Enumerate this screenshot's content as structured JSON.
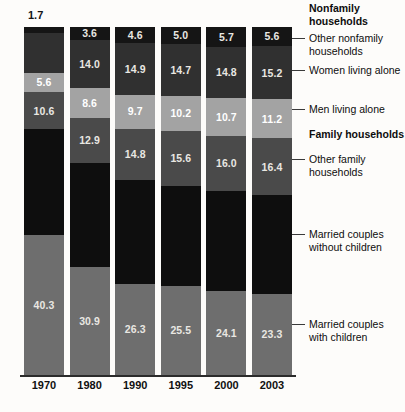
{
  "chart_data": {
    "type": "bar",
    "subtype": "stacked-percentage",
    "title": "",
    "subtitle": "",
    "xlabel": "",
    "ylabel": "",
    "ylim": [
      0,
      100
    ],
    "grid": false,
    "legend_position": "right-callouts",
    "categories": [
      "1970",
      "1980",
      "1990",
      "1995",
      "2000",
      "2003"
    ],
    "stack_order_bottom_to_top": [
      "Married couples with children",
      "Married couples without children",
      "Other family households",
      "Men living alone",
      "Women living alone",
      "Other nonfamily households"
    ],
    "series": [
      {
        "name": "Married couples with children",
        "group": "Family households",
        "color": "#6e6e6e",
        "values": [
          40.3,
          30.9,
          26.3,
          25.5,
          24.1,
          23.3
        ],
        "labels": [
          "40.3",
          "30.9",
          "26.3",
          "25.5",
          "24.1",
          "23.3"
        ],
        "labels_visible": [
          true,
          true,
          true,
          true,
          true,
          true
        ]
      },
      {
        "name": "Married couples without children",
        "group": "Family households",
        "color": "#0e0e0e",
        "values": [
          30.3,
          29.9,
          29.8,
          28.9,
          28.7,
          28.3
        ],
        "labels": [
          "",
          "",
          "",
          "",
          "",
          ""
        ],
        "labels_visible": [
          false,
          false,
          false,
          false,
          false,
          false
        ]
      },
      {
        "name": "Other family households",
        "group": "Family households",
        "color": "#4a4a4a",
        "values": [
          10.6,
          12.9,
          14.8,
          15.6,
          16.0,
          16.4
        ],
        "labels": [
          "10.6",
          "12.9",
          "14.8",
          "15.6",
          "16.0",
          "16.4"
        ],
        "labels_visible": [
          true,
          true,
          true,
          true,
          true,
          true
        ]
      },
      {
        "name": "Men living alone",
        "group": "Nonfamily households",
        "color": "#a3a3a3",
        "values": [
          5.6,
          8.6,
          9.7,
          10.2,
          10.7,
          11.2
        ],
        "labels": [
          "5.6",
          "8.6",
          "9.7",
          "10.2",
          "10.7",
          "11.2"
        ],
        "labels_visible": [
          true,
          true,
          true,
          true,
          true,
          true
        ]
      },
      {
        "name": "Women living alone",
        "group": "Nonfamily households",
        "color": "#303030",
        "values": [
          11.5,
          14.0,
          14.9,
          14.7,
          14.8,
          15.2
        ],
        "labels": [
          "",
          "14.0",
          "14.9",
          "14.7",
          "14.8",
          "15.2"
        ],
        "labels_visible": [
          false,
          true,
          true,
          true,
          true,
          true
        ]
      },
      {
        "name": "Other nonfamily households",
        "group": "Nonfamily households",
        "color": "#151515",
        "values": [
          1.7,
          3.6,
          4.6,
          5.0,
          5.7,
          5.6
        ],
        "labels": [
          "1.7",
          "3.6",
          "4.6",
          "5.0",
          "5.7",
          "5.6"
        ],
        "labels_visible": [
          false,
          true,
          true,
          true,
          true,
          true
        ]
      }
    ],
    "exterior_labels": [
      {
        "category": "1970",
        "series": "Other nonfamily households",
        "text": "1.7"
      }
    ],
    "annotations": [
      {
        "text": "Nonfamily households",
        "bold": true,
        "leader": false,
        "y": 2
      },
      {
        "text": "Other nonfamily\nhouseholds",
        "bold": false,
        "leader": true,
        "y": 32
      },
      {
        "text": "Women living alone",
        "bold": false,
        "leader": true,
        "y": 64
      },
      {
        "text": "Men living alone",
        "bold": false,
        "leader": true,
        "y": 103
      },
      {
        "text": "Family households",
        "bold": true,
        "leader": false,
        "y": 128
      },
      {
        "text": "Other family\nhouseholds",
        "bold": false,
        "leader": true,
        "y": 153
      },
      {
        "text": "Married couples\nwithout children",
        "bold": false,
        "leader": true,
        "y": 228
      },
      {
        "text": "Married couples\nwith children",
        "bold": false,
        "leader": true,
        "y": 318
      }
    ]
  },
  "colors": {
    "background": "#fdfcfa",
    "axis": "#2b2b2b",
    "text": "#0d0d0d",
    "value_text": "#f3f1ec"
  },
  "axis": {
    "tick_labels": [
      "1970",
      "1980",
      "1990",
      "1995",
      "2000",
      "2003"
    ]
  }
}
